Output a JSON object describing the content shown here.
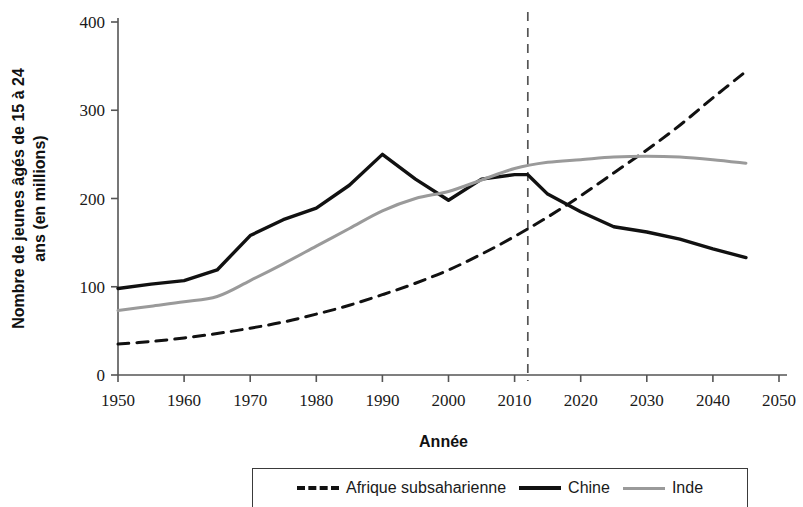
{
  "chart_data": {
    "type": "line",
    "title": "",
    "xlabel": "Année",
    "ylabel": "Nombre de jeunes âgés de 15 à 24 ans (en millions)",
    "xlim": [
      1950,
      2050
    ],
    "ylim": [
      0,
      400
    ],
    "xticks": [
      1950,
      1960,
      1970,
      1980,
      1990,
      2000,
      2010,
      2020,
      2030,
      2040,
      2050
    ],
    "yticks": [
      0,
      100,
      200,
      300,
      400
    ],
    "grid": false,
    "legend_position": "bottom",
    "annotations": [
      {
        "name": "reference-year-line",
        "type": "vline",
        "x": 2012,
        "style": "dashed",
        "color": "#555555"
      }
    ],
    "series": [
      {
        "name": "Afrique subsaharienne",
        "color": "#111111",
        "style": "dashed",
        "width": 3,
        "x": [
          1950,
          1955,
          1960,
          1965,
          1970,
          1975,
          1980,
          1985,
          1990,
          1995,
          2000,
          2005,
          2010,
          2015,
          2020,
          2025,
          2030,
          2035,
          2040,
          2045
        ],
        "values": [
          35,
          38,
          42,
          47,
          53,
          60,
          69,
          79,
          91,
          104,
          119,
          137,
          157,
          179,
          203,
          229,
          255,
          283,
          314,
          344
        ]
      },
      {
        "name": "Chine",
        "color": "#111111",
        "style": "solid",
        "width": 3.4,
        "x": [
          1950,
          1955,
          1960,
          1965,
          1970,
          1975,
          1980,
          1985,
          1990,
          1995,
          2000,
          2005,
          2010,
          2012,
          2015,
          2020,
          2025,
          2030,
          2035,
          2040,
          2045
        ],
        "values": [
          98,
          103,
          107,
          119,
          158,
          176,
          189,
          215,
          250,
          222,
          198,
          222,
          227,
          227,
          205,
          185,
          168,
          162,
          154,
          143,
          133
        ]
      },
      {
        "name": "Inde",
        "color": "#9a9a9a",
        "style": "solid",
        "width": 3,
        "x": [
          1950,
          1955,
          1960,
          1965,
          1970,
          1975,
          1980,
          1985,
          1990,
          1995,
          2000,
          2005,
          2010,
          2015,
          2020,
          2025,
          2030,
          2035,
          2040,
          2045
        ],
        "values": [
          73,
          78,
          83,
          89,
          107,
          126,
          146,
          166,
          186,
          200,
          208,
          221,
          234,
          241,
          244,
          247,
          248,
          247,
          244,
          240
        ]
      }
    ]
  },
  "legend": {
    "items": [
      {
        "label": "Afrique subsaharienne",
        "style": "dashed",
        "color": "#111111"
      },
      {
        "label": "Chine",
        "style": "solid",
        "color": "#111111"
      },
      {
        "label": "Inde",
        "style": "solid",
        "color": "#9a9a9a"
      }
    ]
  }
}
